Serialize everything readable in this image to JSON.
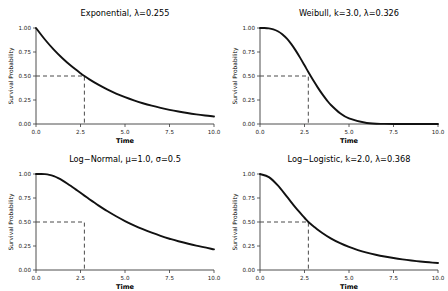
{
  "figure": {
    "background": "#ffffff",
    "curve_color": "#111111",
    "axis_color": "#3a3a3a",
    "median_line_color": "#4a4a4a",
    "rows": 2,
    "cols": 2
  },
  "common": {
    "xlabel": "Time",
    "ylabel": "Survival Probability",
    "xticks": [
      "0.0",
      "2.5",
      "5.0",
      "7.5",
      "10.0"
    ],
    "xtick_values": [
      0,
      2.5,
      5,
      7.5,
      10
    ],
    "yticks": [
      "0.00",
      "0.25",
      "0.50",
      "0.75",
      "1.00"
    ],
    "ytick_values": [
      0,
      0.25,
      0.5,
      0.75,
      1
    ],
    "xlim": [
      0,
      10
    ],
    "ylim": [
      0,
      1
    ],
    "grid": false,
    "legend": null,
    "median_level": 0.5
  },
  "chart_data": [
    {
      "type": "line",
      "panel": "top-left",
      "title": "Exponential,  λ=0.255",
      "distribution": "Exponential",
      "parameters": {
        "lambda": 0.255
      },
      "xlabel": "Time",
      "ylabel": "Survival Probability",
      "xlim": [
        0,
        10
      ],
      "ylim": [
        0,
        1
      ],
      "median_time": 2.718,
      "annotation": "dashed median reference at S(t)=0.50",
      "x": [
        0,
        0.5,
        1,
        1.5,
        2,
        2.5,
        2.718,
        3,
        3.5,
        4,
        4.5,
        5,
        5.5,
        6,
        6.5,
        7,
        7.5,
        8,
        8.5,
        9,
        9.5,
        10
      ],
      "y": [
        1.0,
        0.8803,
        0.7749,
        0.6821,
        0.6005,
        0.5286,
        0.5,
        0.4653,
        0.4096,
        0.3606,
        0.3174,
        0.2794,
        0.246,
        0.2165,
        0.1906,
        0.1678,
        0.1477,
        0.13,
        0.1145,
        0.1008,
        0.0887,
        0.0781
      ]
    },
    {
      "type": "line",
      "panel": "top-right",
      "title": "Weibull,  k=3.0, λ=0.326",
      "distribution": "Weibull",
      "parameters": {
        "k": 3.0,
        "lambda": 0.326
      },
      "xlabel": "Time",
      "ylabel": "Survival Probability",
      "xlim": [
        0,
        10
      ],
      "ylim": [
        0,
        1
      ],
      "median_time": 2.714,
      "annotation": "dashed median reference at S(t)=0.50",
      "x": [
        0,
        0.25,
        0.5,
        0.75,
        1,
        1.25,
        1.5,
        1.75,
        2,
        2.25,
        2.5,
        2.714,
        3,
        3.25,
        3.5,
        3.75,
        4,
        4.5,
        5,
        6,
        7,
        8,
        9,
        10
      ],
      "y": [
        1.0,
        0.9995,
        0.9957,
        0.9855,
        0.9659,
        0.9348,
        0.891,
        0.8345,
        0.767,
        0.6913,
        0.6113,
        0.5417,
        0.4523,
        0.379,
        0.3108,
        0.2493,
        0.1955,
        0.1129,
        0.0589,
        0.0105,
        0.0009,
        4e-05,
        0.0,
        0.0
      ]
    },
    {
      "type": "line",
      "panel": "bottom-left",
      "title": "Log−Normal,  μ=1.0, σ=0.5",
      "distribution": "Log-Normal",
      "parameters": {
        "mu": 1.0,
        "sigma": 0.5
      },
      "xlabel": "Time",
      "ylabel": "Survival Probability",
      "xlim": [
        0,
        10
      ],
      "ylim": [
        0,
        1
      ],
      "median_time": 2.718,
      "annotation": "dashed median reference at S(t)=0.50",
      "x": [
        0,
        0.25,
        0.5,
        0.75,
        1,
        1.25,
        1.5,
        1.75,
        2,
        2.25,
        2.5,
        2.718,
        3,
        3.25,
        3.5,
        4,
        4.5,
        5,
        5.5,
        6,
        6.5,
        7,
        7.5,
        8,
        9,
        10
      ],
      "y": [
        1.0,
        1.0,
        0.9983,
        0.9911,
        0.9772,
        0.9568,
        0.9312,
        0.9018,
        0.8701,
        0.8371,
        0.8038,
        0.7746,
        0.7376,
        0.7052,
        0.6736,
        0.6141,
        0.5596,
        0.51,
        0.4652,
        0.4247,
        0.3883,
        0.3554,
        0.3258,
        0.2991,
        0.2532,
        0.2154
      ]
    },
    {
      "type": "line",
      "panel": "bottom-right",
      "title": "Log−Logistic,  k=2.0, λ=0.368",
      "distribution": "Log-Logistic",
      "parameters": {
        "k": 2.0,
        "lambda": 0.368
      },
      "xlabel": "Time",
      "ylabel": "Survival Probability",
      "xlim": [
        0,
        10
      ],
      "ylim": [
        0,
        1
      ],
      "median_time": 2.717,
      "annotation": "dashed median reference at S(t)=0.50",
      "x": [
        0,
        0.5,
        1,
        1.5,
        2,
        2.5,
        2.717,
        3,
        3.5,
        4,
        4.5,
        5,
        5.5,
        6,
        6.5,
        7,
        7.5,
        8,
        8.5,
        9,
        9.5,
        10
      ],
      "y": [
        1.0,
        0.9672,
        0.8807,
        0.7661,
        0.649,
        0.5443,
        0.5,
        0.4563,
        0.3851,
        0.3266,
        0.2789,
        0.2399,
        0.2078,
        0.1812,
        0.159,
        0.1403,
        0.1244,
        0.1108,
        0.0991,
        0.089,
        0.0802,
        0.0725
      ]
    }
  ]
}
